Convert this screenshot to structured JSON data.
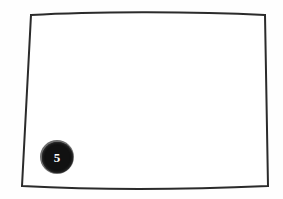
{
  "canvas": {
    "width": 283,
    "height": 199,
    "background_color": "#fefefe"
  },
  "shape": {
    "name": "quadrilateral-outline",
    "description": "Hand-drawn trapezoid outline",
    "stroke_color": "#2b2b2b",
    "fill_color": "#ffffff",
    "stroke_width": 2,
    "path": "M 31 15 C 90 11.5, 190 11, 265 15 L 268 186 C 190 189.5, 95 190, 22 186 Z",
    "corners": {
      "top_left": [
        31,
        15
      ],
      "top_right": [
        265,
        15
      ],
      "bottom_right": [
        268,
        186
      ],
      "bottom_left": [
        22,
        186
      ]
    }
  },
  "badge": {
    "name": "numbered-marker",
    "label": "5",
    "fill_color": "#111111",
    "ring_color": "#6d6d6d",
    "text_color": "#ffffff",
    "center": [
      57,
      157
    ],
    "diameter": 34
  }
}
